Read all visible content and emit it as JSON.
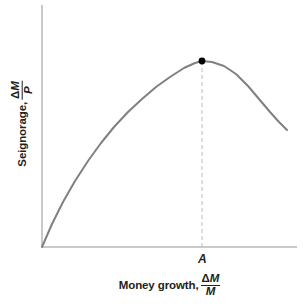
{
  "figure": {
    "background_color": "#ffffff",
    "width": 303,
    "height": 306
  },
  "axes": {
    "color": "#c9c9c9",
    "x_axis": {
      "x_start": 42,
      "x_end": 297,
      "y": 247
    },
    "y_axis": {
      "x": 42,
      "y_start": 5,
      "y_end": 247
    }
  },
  "ylabel": {
    "lead": "Seignorage,",
    "numerator_delta": "Δ",
    "numerator_var": "M",
    "denominator": "P"
  },
  "xlabel": {
    "lead": "Money growth,",
    "numerator_delta": "Δ",
    "numerator_var": "M",
    "denominator": "M"
  },
  "annotations": {
    "peak_point_label": "A"
  },
  "chart_data": {
    "type": "line",
    "title": "",
    "subtitle": "",
    "xlabel": "Money growth, ΔM/M",
    "ylabel": "Seignorage, ΔM/P",
    "grid": false,
    "legend": null,
    "axis_ticks": {
      "x": [],
      "y": []
    },
    "xlim": [
      0,
      1
    ],
    "ylim": [
      0,
      1
    ],
    "series": [
      {
        "name": "Seignorage (Laffer) curve",
        "color": "#808080",
        "linewidth": 2,
        "points_px": [
          [
            42,
            247
          ],
          [
            52,
            224
          ],
          [
            63,
            202
          ],
          [
            75,
            181
          ],
          [
            88,
            161
          ],
          [
            101,
            143
          ],
          [
            114,
            127
          ],
          [
            128,
            112
          ],
          [
            142,
            99
          ],
          [
            156,
            87
          ],
          [
            170,
            77
          ],
          [
            184,
            68
          ],
          [
            195,
            63
          ],
          [
            202,
            61
          ],
          [
            212,
            62
          ],
          [
            224,
            66
          ],
          [
            236,
            74
          ],
          [
            248,
            86
          ],
          [
            259,
            99
          ],
          [
            270,
            112
          ],
          [
            279,
            122
          ],
          [
            287,
            130
          ]
        ],
        "x_normalized": [
          0.0,
          0.04,
          0.08,
          0.13,
          0.18,
          0.23,
          0.28,
          0.34,
          0.39,
          0.45,
          0.5,
          0.56,
          0.6,
          0.63,
          0.67,
          0.71,
          0.76,
          0.81,
          0.85,
          0.89,
          0.93,
          0.96
        ],
        "y_normalized": [
          0.0,
          0.1,
          0.19,
          0.27,
          0.36,
          0.43,
          0.5,
          0.56,
          0.61,
          0.66,
          0.7,
          0.74,
          0.76,
          0.77,
          0.76,
          0.75,
          0.72,
          0.67,
          0.61,
          0.56,
          0.52,
          0.48
        ]
      }
    ],
    "markers": [
      {
        "name": "peak-point",
        "label": "A",
        "x_px": 202,
        "y_px": 61,
        "x_normalized": 0.63,
        "y_normalized": 0.77,
        "color": "#000000",
        "radius_px": 3.4
      }
    ],
    "reference_lines": [
      {
        "name": "peak-dropline",
        "orientation": "vertical",
        "x_px": 202,
        "y_top_px": 61,
        "y_bottom_px": 247,
        "style": "dashed",
        "color": "#cccccc"
      }
    ]
  }
}
